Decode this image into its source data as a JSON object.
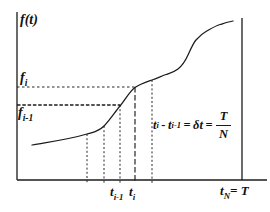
{
  "figure": {
    "colors": {
      "line": "#1b1b1b",
      "ink": "#111111",
      "background": "#ffffff"
    },
    "axis": {
      "y_label": "f(t)",
      "x_end_label": {
        "base": "t",
        "sub": "N",
        "eq": "= T"
      }
    },
    "y_marks": {
      "fi": {
        "base": "f",
        "sub": "i"
      },
      "fim1": {
        "base": "f",
        "sub": "i-1"
      }
    },
    "x_marks": {
      "tim1": {
        "base": "t",
        "sub": "i-1"
      },
      "ti": {
        "base": "t",
        "sub": "i"
      }
    },
    "annotation": {
      "t1_base": "t",
      "t1_sub": "i",
      "minus": "-",
      "t2_base": "t",
      "t2_sub": "i-1",
      "equals1": "=",
      "delta_term": "δt",
      "equals2": "=",
      "frac_num": "T",
      "frac_den": "N"
    },
    "geometry": {
      "curve_path": "M32,145 C50,141.8 69,139.4 87,134 C93,132.2 98,132 104,126 C109,121 115,112 120,106 C125,100 130,90.8 135,87.5 C141,83.6 146,82.1 152,80 C157,78.3 161,76.3 166,74.5 C170,73.1 174,72.2 178,69 C181.5,66.2 184.5,62.7 188,55 C190.7,49.1 193.3,43 196,40 C199.3,36.3 202.7,33.3 206,31.5 C210.7,28.9 215.3,25.9 220,24.5 C224.3,23.2 228.7,21.7 233,21",
      "y_axis": {
        "x1": 17,
        "y1": 12,
        "x2": 17,
        "y2": 180
      },
      "x_axis": {
        "x1": 17,
        "y1": 180,
        "x2": 267,
        "y2": 180
      },
      "right_boundary": {
        "x1": 242,
        "y1": 18,
        "x2": 242,
        "y2": 180
      },
      "h_guides": {
        "fi": {
          "x1": 17,
          "y1": 87,
          "x2": 135,
          "y2": 87,
          "dash": "2.5 2.5"
        },
        "fim1": {
          "x1": 17,
          "y1": 105,
          "x2": 120,
          "y2": 105,
          "dash": "3.5 1.8"
        }
      },
      "v_guides": {
        "g1": {
          "x1": 87,
          "y1": 134,
          "x2": 87,
          "y2": 183,
          "dash": "2 2.2"
        },
        "g2": {
          "x1": 104,
          "y1": 126,
          "x2": 104,
          "y2": 183,
          "dash": "2 2.2"
        },
        "tim1": {
          "x1": 120,
          "y1": 105,
          "x2": 120,
          "y2": 183,
          "dash": "2 2.2"
        },
        "ti": {
          "x1": 135,
          "y1": 87,
          "x2": 135,
          "y2": 183,
          "dash": "5.5 2.5"
        },
        "g5": {
          "x1": 152,
          "y1": 80,
          "x2": 152,
          "y2": 183,
          "dash": "2 2.2"
        }
      }
    }
  }
}
